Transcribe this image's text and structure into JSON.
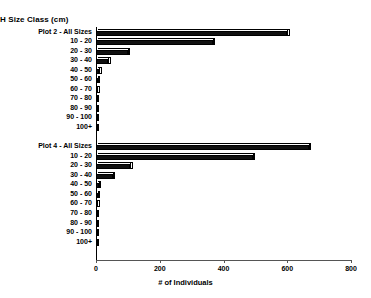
{
  "chart_data": {
    "type": "bar",
    "orientation": "horizontal",
    "title": "H Size Class (cm)",
    "title_note": "left-clipped; full label reads DBH Size Class (cm)",
    "xlabel": "# of Individuals",
    "ylabel": "",
    "xlim": [
      0,
      800
    ],
    "xticks": [
      0,
      200,
      400,
      600,
      800
    ],
    "xtick_labels": [
      "0",
      "200",
      "400",
      "600",
      "800"
    ],
    "grid": false,
    "legend": false,
    "groups": [
      {
        "name": "Plot 2",
        "categories": [
          "Plot 2 - All Sizes",
          "10 - 20",
          "20 - 30",
          "30 - 40",
          "40 - 50",
          "50 - 60",
          "60 - 70",
          "70 - 80",
          "80 - 90",
          "90 - 100",
          "100+"
        ],
        "values": [
          600,
          366,
          100,
          38,
          10,
          6,
          4,
          3,
          2,
          2,
          2
        ]
      },
      {
        "name": "Plot 4",
        "categories": [
          "Plot 4 - All Sizes",
          "10 - 20",
          "20 - 30",
          "30 - 40",
          "40 - 50",
          "50 - 60",
          "60 - 70",
          "70 - 80",
          "80 - 90",
          "90 - 100",
          "100+"
        ],
        "values": [
          668,
          492,
          107,
          53,
          9,
          5,
          4,
          3,
          3,
          2,
          2
        ]
      }
    ]
  }
}
